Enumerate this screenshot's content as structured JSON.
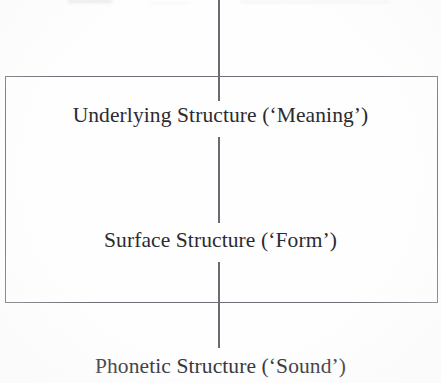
{
  "figure": {
    "levels": [
      {
        "id": "underlying",
        "label": "Underlying Structure (‘Meaning’)",
        "name": "Underlying Structure",
        "gloss": "‘Meaning’",
        "inside_box": true
      },
      {
        "id": "surface",
        "label": "Surface Structure (‘Form’)",
        "name": "Surface Structure",
        "gloss": "‘Form’",
        "inside_box": true
      },
      {
        "id": "phonetic",
        "label": "Phonetic Structure (‘Sound’)",
        "name": "Phonetic Structure",
        "gloss": "‘Sound’",
        "inside_box": false
      }
    ],
    "box": {
      "name": "grammar-enclosure",
      "encloses": [
        "underlying",
        "surface"
      ],
      "stroke_color": "#6f7077"
    },
    "connector": {
      "name": "vertical-derivation-line",
      "orientation": "vertical",
      "stroke_color": "#6a6b72",
      "segments": 3
    },
    "colors": {
      "background": "#fefefe",
      "text": "#2b2b30",
      "rule": "#6f7077"
    }
  }
}
